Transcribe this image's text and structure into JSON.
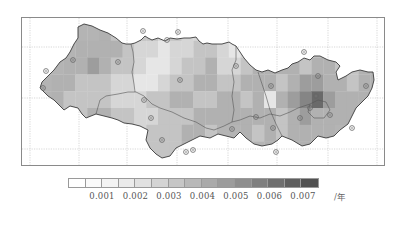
{
  "map": {
    "type": "choropleth-grid",
    "gridlines": "dotted",
    "colorscale": "grayscale, light = low, dark = high",
    "grid_values": [
      [
        null,
        null,
        null,
        null,
        null,
        5,
        4,
        4,
        4,
        4,
        3,
        4,
        3,
        3,
        3,
        3,
        4,
        4,
        5,
        null,
        null,
        null,
        null,
        null,
        null,
        null,
        null,
        null,
        null
      ],
      [
        null,
        null,
        null,
        5,
        5,
        5,
        5,
        4,
        3,
        3,
        2,
        3,
        3,
        4,
        4,
        3,
        2,
        3,
        4,
        5,
        5,
        null,
        null,
        4,
        5,
        5,
        null,
        null,
        null
      ],
      [
        null,
        null,
        5,
        5,
        6,
        5,
        4,
        4,
        3,
        2,
        2,
        3,
        4,
        4,
        5,
        3,
        3,
        4,
        5,
        5,
        5,
        5,
        4,
        5,
        5,
        4,
        4,
        5,
        null
      ],
      [
        null,
        5,
        5,
        4,
        4,
        4,
        3,
        3,
        2,
        2,
        3,
        4,
        4,
        5,
        5,
        4,
        4,
        5,
        5,
        5,
        4,
        5,
        6,
        6,
        5,
        5,
        4,
        5,
        5
      ],
      [
        null,
        5,
        4,
        4,
        4,
        4,
        3,
        3,
        3,
        4,
        4,
        5,
        5,
        4,
        4,
        5,
        5,
        4,
        5,
        2,
        5,
        6,
        7,
        8,
        6,
        5,
        5,
        5,
        null
      ],
      [
        null,
        null,
        4,
        4,
        5,
        5,
        4,
        4,
        3,
        3,
        4,
        4,
        4,
        5,
        5,
        5,
        5,
        5,
        5,
        5,
        4,
        5,
        6,
        5,
        5,
        5,
        5,
        null,
        null
      ],
      [
        null,
        null,
        null,
        5,
        null,
        null,
        4,
        4,
        3,
        4,
        4,
        4,
        5,
        5,
        4,
        null,
        null,
        5,
        4,
        5,
        4,
        5,
        5,
        5,
        5,
        null,
        null,
        null,
        null
      ],
      [
        null,
        null,
        null,
        null,
        null,
        null,
        null,
        null,
        4,
        4,
        4,
        4,
        null,
        null,
        null,
        null,
        null,
        null,
        null,
        5,
        5,
        5,
        5,
        5,
        null,
        null,
        null,
        null,
        null
      ]
    ],
    "stations_count": 27
  },
  "legend": {
    "colors": [
      "#ffffff",
      "#fafafa",
      "#f3f3f3",
      "#ebebeb",
      "#e1e1e1",
      "#d4d4d4",
      "#c6c6c6",
      "#b8b8b8",
      "#aaaaaa",
      "#9c9c9c",
      "#8e8e8e",
      "#7f7f7f",
      "#6f6f6f",
      "#5f5f5f",
      "#515151"
    ],
    "tick_labels": [
      "0.001",
      "0.002",
      "0.003",
      "0.004",
      "0.005",
      "0.006",
      "0.007"
    ],
    "unit": "/年"
  }
}
